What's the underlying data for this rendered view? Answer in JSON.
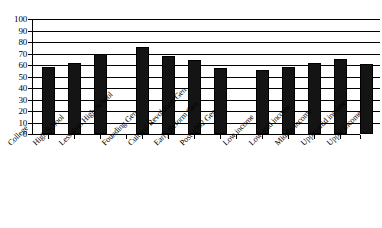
{
  "chart_data": {
    "type": "bar",
    "title": "",
    "subtitle": "",
    "xlabel": "",
    "ylabel": "",
    "ylim": [
      0,
      100
    ],
    "yticks": [
      0,
      10,
      20,
      30,
      40,
      50,
      60,
      70,
      80,
      90,
      100
    ],
    "grid": true,
    "legend": false,
    "legend_position": "none",
    "bar_color": "#141414",
    "axis_color": "#000000",
    "gridline_color": "#000000",
    "background_color": "#ffffff",
    "orientation": "vertical",
    "categories": [
      "College",
      "High School",
      "Less than High School",
      "Founding Gen",
      "Cultural Revolution Gen",
      "Early Reform Gen",
      "Post-1992 Gen",
      "Low income",
      "Low-mid income",
      "Middle income",
      "Upper-mid income",
      "Upper income"
    ],
    "values": [
      58,
      62,
      70,
      76,
      68,
      64,
      57,
      56,
      58,
      62,
      65,
      61
    ],
    "groups": [
      {
        "name": "Education",
        "categories": [
          "College",
          "High School",
          "Less than High School"
        ]
      },
      {
        "name": "Generation",
        "categories": [
          "Founding Gen",
          "Cultural Revolution Gen",
          "Early Reform Gen",
          "Post-1992 Gen"
        ]
      },
      {
        "name": "Income",
        "categories": [
          "Low income",
          "Low-mid income",
          "Middle income",
          "Upper-mid income",
          "Upper income"
        ]
      }
    ]
  }
}
